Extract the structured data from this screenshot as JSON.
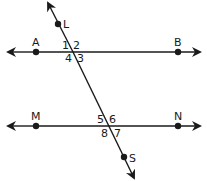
{
  "diagram": {
    "type": "parallel-lines-cut-by-transversal",
    "stroke_color": "#1a1a1a",
    "background": "#ffffff",
    "lines": [
      {
        "name": "AB",
        "points": [
          "A",
          "B"
        ]
      },
      {
        "name": "MN",
        "points": [
          "M",
          "N"
        ]
      },
      {
        "name": "LS",
        "points": [
          "L",
          "S"
        ],
        "role": "transversal"
      }
    ],
    "points": {
      "A": "A",
      "B": "B",
      "M": "M",
      "N": "N",
      "L": "L",
      "S": "S"
    },
    "angles_top": {
      "a1": "1",
      "a2": "2",
      "a3": "3",
      "a4": "4"
    },
    "angles_bottom": {
      "a5": "5",
      "a6": "6",
      "a7": "7",
      "a8": "8"
    }
  }
}
